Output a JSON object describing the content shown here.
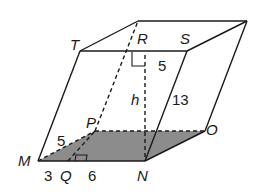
{
  "figure": {
    "colors": {
      "stroke": "#1a1a1a",
      "base_fill": "#8c8c8c",
      "background": "#ffffff"
    },
    "vertices": {
      "T": "T",
      "R": "R",
      "S": "S",
      "P": "P",
      "O": "O",
      "M": "M",
      "N": "N",
      "Q": "Q"
    },
    "measurements": {
      "top_segment": "5",
      "height": "h",
      "lateral_edge": "13",
      "base_slant": "5",
      "MQ": "3",
      "QN": "6"
    }
  }
}
